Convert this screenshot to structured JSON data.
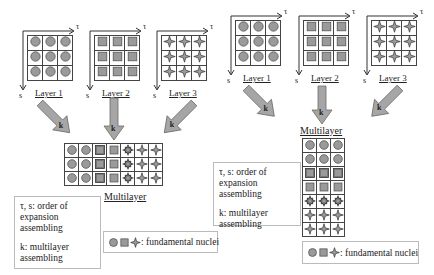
{
  "colors": {
    "nucleus_fill": "#9a9a9a",
    "nucleus_stroke": "#555555",
    "arrow_fill": "#a6a6a6",
    "arrow_stroke": "#6a6a6a",
    "grid_line": "#444444",
    "box_border": "#bbbbbb"
  },
  "axes": {
    "horizontal": "τ",
    "vertical": "s"
  },
  "left_panel": {
    "layers": [
      {
        "label": "Layer 1",
        "nucleus": "circle"
      },
      {
        "label": "Layer 2",
        "nucleus": "square"
      },
      {
        "label": "Layer 3",
        "nucleus": "star"
      }
    ],
    "arrow_label": "k",
    "multilayer": {
      "label": "Multilayer",
      "orientation": "horizontal",
      "rows": 3,
      "columns": [
        "circle",
        "circle",
        "framed-square",
        "square",
        "framed-star",
        "star",
        "star"
      ]
    },
    "legend": {
      "line1": "τ, s: order of",
      "line2": "expansion assembling",
      "line3": "k: multilayer",
      "line4": "assembling"
    },
    "nuclei_legend": {
      "text": ": fundamental nuclei"
    }
  },
  "right_panel": {
    "layers": [
      {
        "label": "Layer 1",
        "nucleus": "circle"
      },
      {
        "label": "Layer 2",
        "nucleus": "square"
      },
      {
        "label": "Layer 3",
        "nucleus": "star"
      }
    ],
    "arrow_label": "k",
    "multilayer": {
      "label": "Multilayer",
      "orientation": "vertical",
      "columns": 3,
      "rows": [
        "circle",
        "circle",
        "framed-square",
        "square",
        "framed-star",
        "star",
        "star"
      ]
    },
    "legend": {
      "line1": "τ, s: order of",
      "line2": "expansion assembling",
      "line3": "k: multilayer",
      "line4": "assembling"
    },
    "nuclei_legend": {
      "text": ": fundamental nuclei"
    }
  }
}
